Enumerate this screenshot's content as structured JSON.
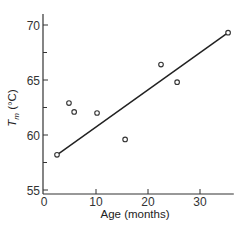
{
  "chart_data": {
    "type": "scatter",
    "title": "",
    "xlabel": "Age (months)",
    "ylabel_main": "T",
    "ylabel_sub": "m",
    "ylabel_unit": " (°C)",
    "xlim": [
      0,
      36.5
    ],
    "ylim": [
      55,
      71
    ],
    "x_ticks": [
      0,
      10,
      20,
      30
    ],
    "y_ticks": [
      55,
      60,
      65,
      70
    ],
    "y_minor_ticks": [
      57.5,
      62.5,
      67.5
    ],
    "grid": false,
    "legend": null,
    "series": [
      {
        "name": "measurements",
        "marker": "open-circle",
        "points": [
          {
            "x": 2.5,
            "y": 58.2
          },
          {
            "x": 4.8,
            "y": 62.9
          },
          {
            "x": 5.8,
            "y": 62.1
          },
          {
            "x": 10.2,
            "y": 62.0
          },
          {
            "x": 15.6,
            "y": 59.6
          },
          {
            "x": 22.5,
            "y": 66.4
          },
          {
            "x": 25.6,
            "y": 64.8
          },
          {
            "x": 35.4,
            "y": 69.3
          }
        ]
      }
    ],
    "fit_line": {
      "x1": 2.5,
      "y1": 58.2,
      "x2": 35.4,
      "y2": 69.3
    },
    "colors": {
      "axis": "#333333",
      "line": "#222222",
      "marker": "#333333"
    }
  }
}
